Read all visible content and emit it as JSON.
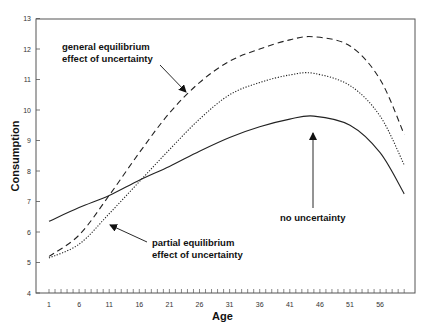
{
  "chart_data": {
    "type": "line",
    "title": "",
    "xlabel": "Age",
    "ylabel": "Consumption",
    "xlim": [
      0,
      61
    ],
    "ylim": [
      4,
      13
    ],
    "grid": false,
    "legend": "none (curves identified by in-plot annotations)",
    "x_tick_labels": [
      "1",
      "6",
      "11",
      "16",
      "21",
      "26",
      "31",
      "36",
      "41",
      "46",
      "51",
      "56"
    ],
    "y_tick_labels": [
      "4",
      "5",
      "6",
      "7",
      "8",
      "9",
      "10",
      "11",
      "12",
      "13"
    ],
    "x": [
      1,
      6,
      11,
      16,
      21,
      26,
      31,
      36,
      41,
      45,
      51,
      56,
      60
    ],
    "series": [
      {
        "name": "general equilibrium (with uncertainty)",
        "style": "dashed",
        "values": [
          5.2,
          5.9,
          7.2,
          8.6,
          9.9,
          10.9,
          11.6,
          12.0,
          12.3,
          12.4,
          12.1,
          11.0,
          9.2
        ]
      },
      {
        "name": "partial equilibrium (with uncertainty)",
        "style": "dotted",
        "values": [
          5.15,
          5.6,
          6.6,
          7.65,
          8.7,
          9.7,
          10.5,
          10.9,
          11.15,
          11.2,
          10.8,
          9.8,
          8.2
        ]
      },
      {
        "name": "no uncertainty",
        "style": "solid",
        "values": [
          6.35,
          6.8,
          7.2,
          7.7,
          8.15,
          8.65,
          9.1,
          9.45,
          9.7,
          9.8,
          9.5,
          8.6,
          7.25
        ]
      }
    ],
    "annotations": [
      {
        "text_lines": [
          "general equilibrium",
          "effect of uncertainty"
        ],
        "points_to": "dashed curve near age 24"
      },
      {
        "text_lines": [
          "partial equilibrium",
          "effect of uncertainty"
        ],
        "points_to": "gap between curves near age 13"
      },
      {
        "text_lines": [
          "no uncertainty"
        ],
        "points_to": "solid curve near age 44"
      }
    ]
  },
  "labels": {
    "xlabel": "Age",
    "ylabel": "Consumption",
    "ge_line1": "general equilibrium",
    "ge_line2": "effect of uncertainty",
    "pe_line1": "partial equilibrium",
    "pe_line2": "effect of uncertainty",
    "nu_line1": "no uncertainty"
  }
}
